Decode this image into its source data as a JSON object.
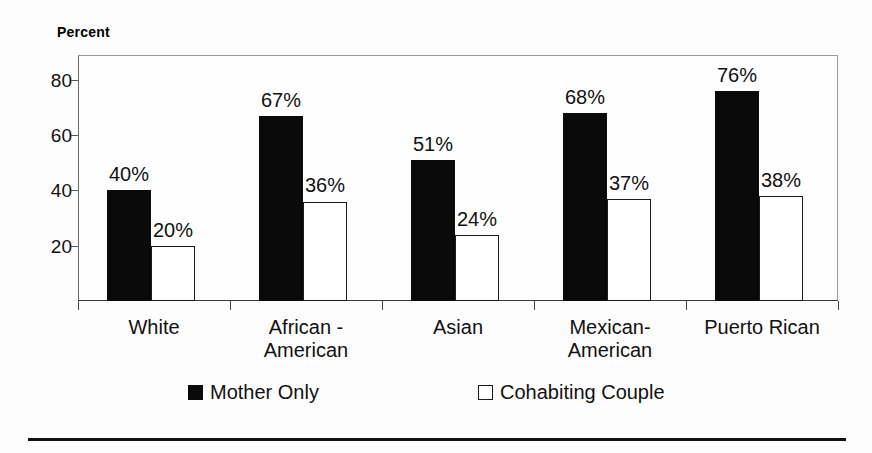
{
  "figure": {
    "axis_title": "Percent",
    "background_color": "#fdfdfd",
    "frame_color": "#8e8e8e"
  },
  "chart_data": {
    "type": "bar",
    "title": "",
    "subtitle": "",
    "xlabel": "",
    "ylabel": "Percent",
    "ylim": [
      0,
      89
    ],
    "yticks": [
      20,
      40,
      60,
      80
    ],
    "ytick_labels": [
      "20",
      "40",
      "60",
      "80"
    ],
    "grid": false,
    "legend_position": "bottom",
    "categories": [
      "White",
      "African -\nAmerican",
      "Asian",
      "Mexican-\nAmerican",
      "Puerto Rican"
    ],
    "series": [
      {
        "name": "Mother Only",
        "style": "solid-black",
        "color": "#0a0a0a",
        "values": [
          40,
          67,
          51,
          68,
          76
        ],
        "labels": [
          "40%",
          "67%",
          "51%",
          "68%",
          "76%"
        ]
      },
      {
        "name": "Cohabiting Couple",
        "style": "hollow-white",
        "color": "#ffffff",
        "border_color": "#1a1a1a",
        "values": [
          20,
          36,
          24,
          37,
          38
        ],
        "labels": [
          "20%",
          "36%",
          "24%",
          "37%",
          "38%"
        ]
      }
    ]
  },
  "legend": {
    "items": [
      {
        "label": "Mother Only",
        "style": "solid"
      },
      {
        "label": "Cohabiting Couple",
        "style": "hollow"
      }
    ]
  }
}
